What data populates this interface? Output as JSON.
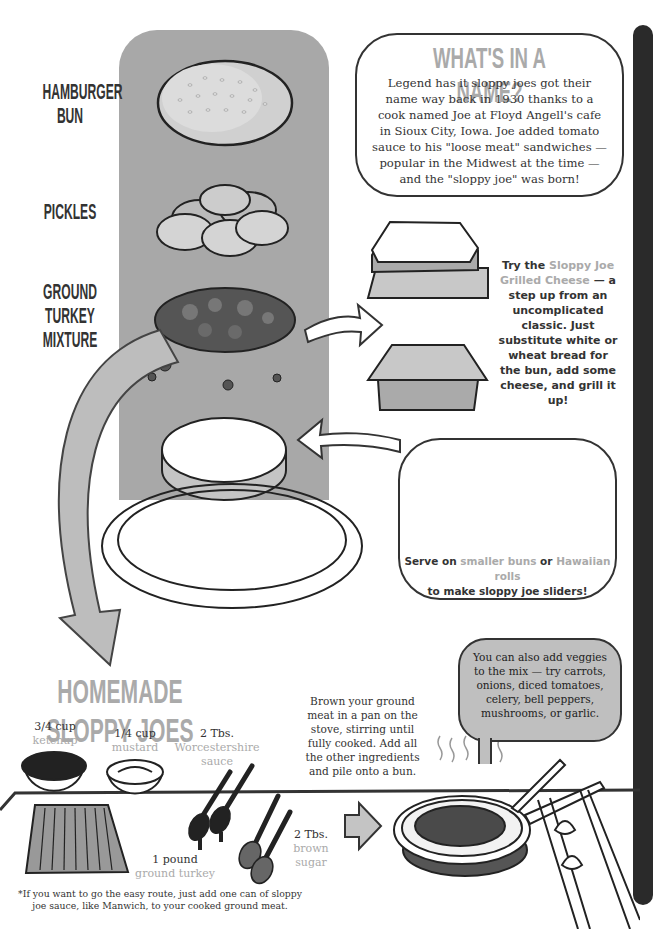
{
  "left_labels": {
    "bun": "HAMBURGER BUN",
    "pickles": "PICKLES",
    "mixture": "GROUND TURKEY MIXTURE"
  },
  "name_box": {
    "title": "WHAT'S IN A NAME?",
    "body": "Legend has it sloppy joes got their name way back in 1930 thanks to a cook named Joe at Floyd Angell's cafe in Sioux City, Iowa. Joe added tomato sauce to his \"loose meat\" sandwiches — popular in the Midwest at the time — and the \"sloppy joe\" was born!"
  },
  "grilled_cheese_tip": {
    "prefix": "Try the ",
    "highlight": "Sloppy Joe Grilled Cheese",
    "suffix": " — a step up from an uncomplicated classic. Just substitute white or wheat bread for the bun, add some cheese, and grill it up!"
  },
  "sliders_tip": {
    "part1": "Serve on ",
    "highlight1": "smaller buns",
    "part2": " or ",
    "highlight2": "Hawaiian rolls",
    "part3": " to make sloppy joe sliders!"
  },
  "recipe": {
    "title": "HOMEMADE SLOPPY JOES",
    "ingredients": [
      {
        "amount": "3/4 cup",
        "name": "ketchup"
      },
      {
        "amount": "1/4 cup",
        "name": "mustard"
      },
      {
        "amount": "2 Tbs.",
        "name": "Worcestershire sauce"
      },
      {
        "amount": "1 pound",
        "name": "ground turkey"
      },
      {
        "amount": "2 Tbs.",
        "name": "brown sugar"
      }
    ],
    "instructions": "Brown your ground meat in a pan on the stove, stirring until fully cooked. Add all the other ingredients and pile onto a bun.",
    "veggie_tip": "You can also add veggies to the mix — try carrots, onions, diced tomatoes, celery, bell peppers, mushrooms, or garlic.",
    "footnote": "*If you want to go the easy route, just add one can of sloppy joe sauce, like Manwich, to your cooked ground meat."
  },
  "colors": {
    "accent_gray": "#aaaaaa",
    "column_gray": "#a8a8a8",
    "ink": "#333333",
    "dark_strip": "#2a2a2a"
  }
}
